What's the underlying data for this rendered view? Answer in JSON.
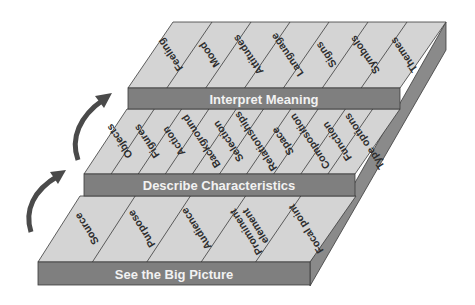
{
  "diagram": {
    "colors": {
      "top_face": "#d4d4d4",
      "band": "#7f7f7f",
      "side": "#8a8a8a",
      "side_dark": "#6e6e6e",
      "line": "#3a3a3a",
      "arrow": "#4a4a4a",
      "band_text": "#f2f2f2",
      "cell_text": "#2e2e2e"
    },
    "steps": [
      {
        "label": "See the Big Picture",
        "items": [
          "Source",
          "Purpose",
          "Audience",
          "Prominent element",
          "Focal point"
        ]
      },
      {
        "label": "Describe Characteristics",
        "items": [
          "Objects",
          "Figures",
          "Action",
          "Background",
          "Selection",
          "Relationships",
          "Space",
          "Composition",
          "Function",
          "Type options"
        ]
      },
      {
        "label": "Interpret Meaning",
        "items": [
          "Feeling",
          "Mood",
          "Attitudes",
          "Language",
          "Signs",
          "Symbols",
          "Themes"
        ]
      }
    ],
    "arrows": [
      "arrow-step1-to-step2",
      "arrow-step2-to-step3"
    ]
  }
}
